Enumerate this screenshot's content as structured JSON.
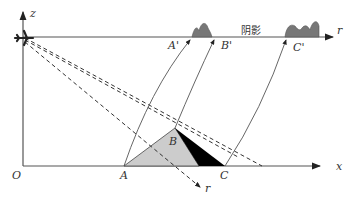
{
  "diagram": {
    "axes": {
      "z_label": "z",
      "x_label": "x",
      "origin_label": "O",
      "slant_range_label": "r",
      "image_range_label": "r"
    },
    "ground_points": {
      "A": "A",
      "B": "B",
      "C": "C"
    },
    "image_points": {
      "A_prime": "A'",
      "B_prime": "B'",
      "C_prime": "C'"
    },
    "shadow_label": "阴影",
    "colors": {
      "axis": "#555555",
      "lit_slope": "#cccccc",
      "shadow_slope": "#000000",
      "image_bumps": "#777777",
      "dashed_lines": "#333333",
      "arcs": "#555555"
    }
  }
}
